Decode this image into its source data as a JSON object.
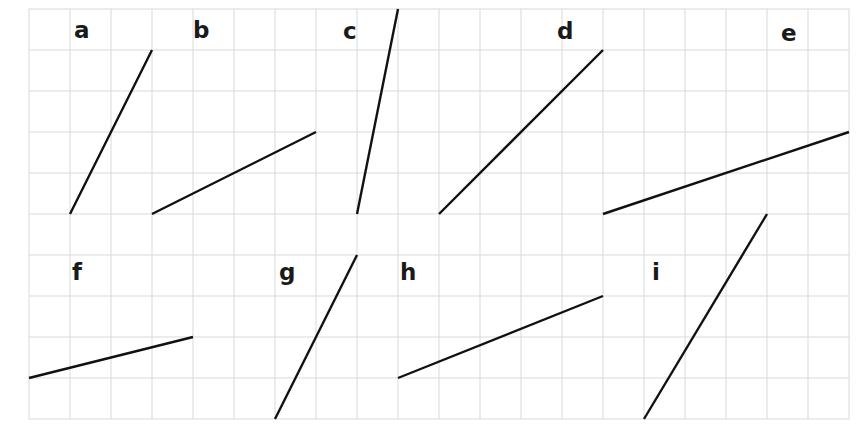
{
  "grid": {
    "origin_x": 29,
    "origin_y": 9,
    "cell": 41,
    "cols": 20,
    "rows": 10,
    "line_color": "#d9d9d9",
    "segment_color": "#111111"
  },
  "segments": [
    {
      "label": "a",
      "from": [
        1,
        5
      ],
      "to": [
        3,
        1
      ],
      "label_pos": [
        74,
        38
      ]
    },
    {
      "label": "b",
      "from": [
        3,
        5
      ],
      "to": [
        7,
        3
      ],
      "label_pos": [
        193,
        38
      ]
    },
    {
      "label": "c",
      "from": [
        8,
        5
      ],
      "to": [
        9,
        0
      ],
      "label_pos": [
        343,
        39
      ]
    },
    {
      "label": "d",
      "from": [
        10,
        5
      ],
      "to": [
        14,
        1
      ],
      "label_pos": [
        557,
        39
      ]
    },
    {
      "label": "e",
      "from": [
        14,
        5
      ],
      "to": [
        20,
        3
      ],
      "label_pos": [
        781,
        41
      ]
    },
    {
      "label": "f",
      "from": [
        0,
        9
      ],
      "to": [
        4,
        8
      ],
      "label_pos": [
        72,
        280
      ]
    },
    {
      "label": "g",
      "from": [
        6,
        10
      ],
      "to": [
        8,
        6
      ],
      "label_pos": [
        279,
        280
      ]
    },
    {
      "label": "h",
      "from": [
        9,
        9
      ],
      "to": [
        14,
        7
      ],
      "label_pos": [
        400,
        280
      ]
    },
    {
      "label": "i",
      "from": [
        15,
        10
      ],
      "to": [
        18,
        5
      ],
      "label_pos": [
        652,
        280
      ]
    }
  ]
}
